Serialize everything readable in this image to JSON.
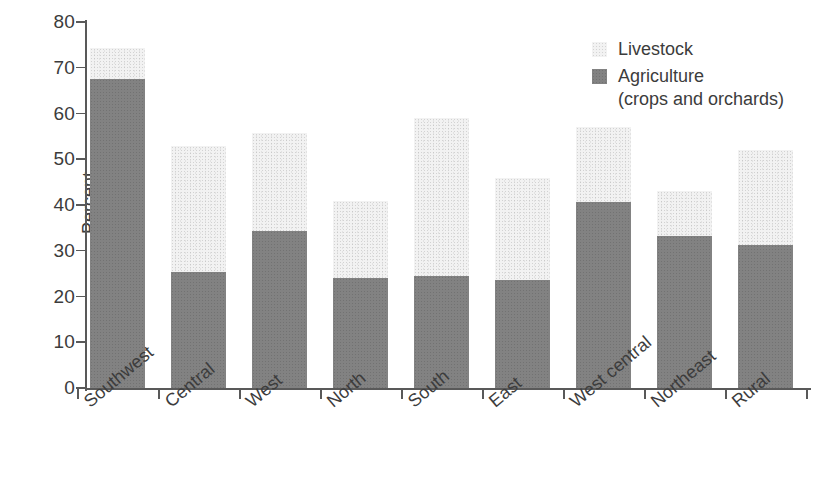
{
  "chart_data": {
    "type": "bar",
    "subtype": "stacked-bar",
    "title": "",
    "xlabel": "",
    "ylabel": "Percent",
    "ylim": [
      0,
      80
    ],
    "yticks": [
      0,
      10,
      20,
      30,
      40,
      50,
      60,
      70,
      80
    ],
    "ytick_labels": [
      "0",
      "10",
      "20",
      "30",
      "40",
      "50",
      "60",
      "70",
      "80"
    ],
    "grid": false,
    "legend_position": "top-right",
    "categories": [
      "Southwest",
      "Central",
      "West",
      "North",
      "South",
      "East",
      "West central",
      "Northeast",
      "Rural"
    ],
    "series": [
      {
        "name": "Agriculture (crops and orchards)",
        "color": "#828282",
        "values": [
          67.6,
          25.4,
          34.3,
          24.0,
          24.4,
          23.6,
          40.6,
          33.2,
          31.2
        ]
      },
      {
        "name": "Livestock",
        "color": "#f2f2f2",
        "values": [
          6.7,
          27.6,
          21.5,
          16.8,
          34.6,
          22.4,
          16.4,
          9.8,
          20.8
        ]
      }
    ],
    "totals": [
      74.3,
      53.0,
      55.8,
      40.8,
      59.0,
      46.0,
      57.0,
      43.0,
      52.0
    ],
    "annotations": []
  },
  "legend": {
    "items": [
      {
        "label": "Livestock",
        "sublabel": "",
        "swatch": "#f2f2f2"
      },
      {
        "label": "Agriculture",
        "sublabel": "(crops and orchards)",
        "swatch": "#828282"
      }
    ]
  }
}
